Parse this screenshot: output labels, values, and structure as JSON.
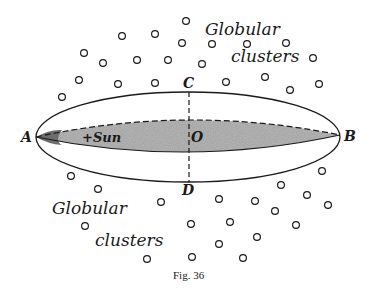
{
  "figure": {
    "caption": "Fig. 36",
    "colors": {
      "ink": "#1a1a1a",
      "disk_fill": "#a9a9a9",
      "background": "#ffffff"
    },
    "points": {
      "A": "A",
      "B": "B",
      "C": "C",
      "D": "D",
      "O": "O"
    },
    "sun_label": "+Sun",
    "cluster_labels": [
      {
        "line1": "Globular",
        "line2": "clusters",
        "position": "upper-right"
      },
      {
        "line1": "Globular",
        "line2": "clusters",
        "position": "lower-left"
      }
    ],
    "clusters_upper": [
      [
        186,
        21
      ],
      [
        122,
        36
      ],
      [
        155,
        34
      ],
      [
        182,
        43
      ],
      [
        84,
        53
      ],
      [
        103,
        63
      ],
      [
        137,
        60
      ],
      [
        168,
        60
      ],
      [
        79,
        80
      ],
      [
        118,
        84
      ],
      [
        155,
        83
      ],
      [
        62,
        97
      ],
      [
        212,
        44
      ],
      [
        247,
        44
      ],
      [
        286,
        43
      ],
      [
        202,
        64
      ],
      [
        313,
        58
      ],
      [
        226,
        82
      ],
      [
        265,
        77
      ],
      [
        290,
        90
      ],
      [
        319,
        84
      ]
    ],
    "clusters_lower": [
      [
        71,
        176
      ],
      [
        98,
        189
      ],
      [
        161,
        202
      ],
      [
        85,
        226
      ],
      [
        191,
        224
      ],
      [
        147,
        259
      ],
      [
        192,
        257
      ],
      [
        322,
        171
      ],
      [
        281,
        185
      ],
      [
        307,
        195
      ],
      [
        219,
        199
      ],
      [
        255,
        201
      ],
      [
        328,
        205
      ],
      [
        275,
        211
      ],
      [
        230,
        222
      ],
      [
        296,
        225
      ],
      [
        257,
        237
      ],
      [
        219,
        244
      ],
      [
        243,
        258
      ]
    ]
  }
}
